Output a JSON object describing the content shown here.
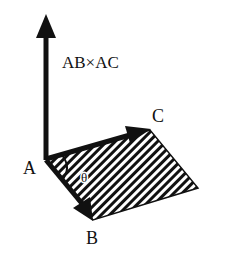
{
  "diagram": {
    "labels": {
      "cross_product": "AB×AC",
      "vertex_a": "A",
      "vertex_b": "B",
      "vertex_c": "C",
      "angle": "θ"
    },
    "colors": {
      "ink": "#111111",
      "background": "#ffffff"
    },
    "elements": [
      {
        "name": "vector-ab-cross-ac",
        "from": "A",
        "direction": "up",
        "label": "AB×AC"
      },
      {
        "name": "vector-ac",
        "from": "A",
        "to": "C",
        "label": "C"
      },
      {
        "name": "vector-ab",
        "from": "A",
        "to": "B",
        "label": "B"
      },
      {
        "name": "parallelogram",
        "vertices": [
          "A",
          "B",
          "D",
          "C"
        ],
        "fill": "hatched"
      },
      {
        "name": "angle-arc",
        "between": [
          "AB",
          "AC"
        ],
        "label": "θ"
      }
    ]
  }
}
